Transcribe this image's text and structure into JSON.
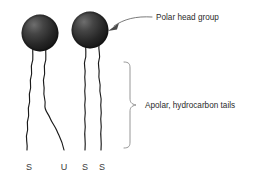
{
  "figure": {
    "background_color": "#ffffff",
    "width": 260,
    "height": 183
  },
  "annotations": {
    "head_label": "Polar head group",
    "tails_label": "Apolar, hydrocarbon tails"
  },
  "molecules": [
    {
      "name": "molecule-left",
      "head": {
        "cx": 40,
        "cy": 33,
        "r": 18.5,
        "color": "#2b2b2b",
        "highlight_color": "#5a5a5a"
      },
      "tails": [
        {
          "name": "tail-left-outer",
          "end_label": "S",
          "label_x": 29,
          "label_y": 170
        },
        {
          "name": "tail-left-inner",
          "end_label": "U",
          "label_x": 64,
          "label_y": 170
        }
      ]
    },
    {
      "name": "molecule-right",
      "head": {
        "cx": 90,
        "cy": 30,
        "r": 18.5,
        "color": "#2b2b2b",
        "highlight_color": "#5a5a5a"
      },
      "tails": [
        {
          "name": "tail-right-outer",
          "end_label": "S",
          "label_x": 85,
          "label_y": 170
        },
        {
          "name": "tail-right-inner",
          "end_label": "S",
          "label_x": 102,
          "label_y": 170
        }
      ]
    }
  ],
  "subunit_labels": [
    {
      "text": "S",
      "x": 29,
      "y": 170
    },
    {
      "text": "U",
      "x": 64,
      "y": 170
    },
    {
      "text": "S",
      "x": 85,
      "y": 170
    },
    {
      "text": "S",
      "x": 102,
      "y": 170
    }
  ],
  "colors": {
    "head_dark": "#2b2b2b",
    "head_highlight": "#5a5a5a",
    "tail_stroke": "#1a1a1a",
    "leader_stroke": "#6b6b6b",
    "brace_stroke": "#8a8a8a",
    "text": "#2b2b2b"
  }
}
